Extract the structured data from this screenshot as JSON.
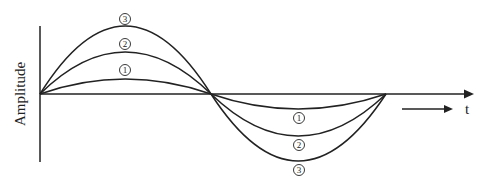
{
  "diagram": {
    "y_axis_label": "Amplitude",
    "x_axis_label": "t",
    "curves": [
      {
        "id": "1",
        "label": "1",
        "pos_peak_y": 79,
        "neg_peak_y": 109
      },
      {
        "id": "2",
        "label": "2",
        "pos_peak_y": 52,
        "neg_peak_y": 136
      },
      {
        "id": "3",
        "label": "3",
        "pos_peak_y": 26,
        "neg_peak_y": 161
      }
    ],
    "line_color": "#222222"
  }
}
